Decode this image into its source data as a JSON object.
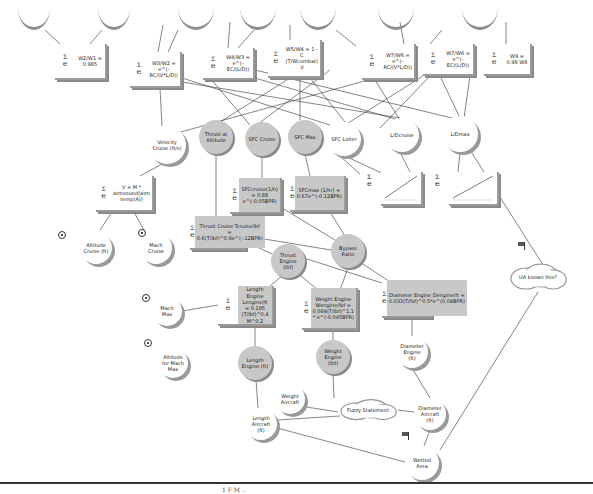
{
  "diagram": {
    "type": "influence-diagram",
    "formula_glyph": "Σ/e",
    "top_arcs": [
      {
        "x": 18,
        "y": 8,
        "w": 32,
        "h": 22
      },
      {
        "x": 98,
        "y": 8,
        "w": 32,
        "h": 22
      },
      {
        "x": 178,
        "y": 8,
        "w": 36,
        "h": 22
      },
      {
        "x": 240,
        "y": 8,
        "w": 36,
        "h": 22
      },
      {
        "x": 300,
        "y": 8,
        "w": 36,
        "h": 22
      },
      {
        "x": 378,
        "y": 8,
        "w": 36,
        "h": 22
      },
      {
        "x": 462,
        "y": 8,
        "w": 36,
        "h": 22
      }
    ],
    "function_nodes": [
      {
        "id": "w2w1",
        "label": "W2/W1 = 0.985",
        "x": 55,
        "y": 44,
        "w": 52,
        "h": 36,
        "gray": false
      },
      {
        "id": "w3w2",
        "label": "W3/W2 = e^(-RC/(V*L/D))",
        "x": 130,
        "y": 52,
        "w": 52,
        "h": 36,
        "gray": false
      },
      {
        "id": "w4w3",
        "label": "W4/W3 = e^(-EC/(L/D))",
        "x": 203,
        "y": 48,
        "w": 52,
        "h": 32,
        "gray": false
      },
      {
        "id": "w5w4",
        "label": "W5/W4 = 1 - C (T/Wcombat) d",
        "x": 268,
        "y": 40,
        "w": 54,
        "h": 38,
        "gray": false
      },
      {
        "id": "w7w6a",
        "label": "W7/W6 = e^(-RC/(V*L/D))",
        "x": 362,
        "y": 44,
        "w": 54,
        "h": 36,
        "gray": false
      },
      {
        "id": "w7w6b",
        "label": "W7/W6 = e^(-EC/(L/D))",
        "x": 423,
        "y": 44,
        "w": 52,
        "h": 32,
        "gray": false
      },
      {
        "id": "w9",
        "label": "W9 = 0.98 W8",
        "x": 484,
        "y": 44,
        "w": 48,
        "h": 32,
        "gray": false
      },
      {
        "id": "velocity",
        "label": "V = M * atmsound(atm temp(A))",
        "x": 96,
        "y": 176,
        "w": 58,
        "h": 36,
        "gray": false
      },
      {
        "id": "sfccruise_fn",
        "label": "SFCcruise(1/h) = 0.88 e^(-0.05BPR)",
        "x": 230,
        "y": 178,
        "w": 52,
        "h": 36,
        "gray": true
      },
      {
        "id": "sfcmax_fn",
        "label": "SFCmax (1/hr) = 0.67e^(-0.12BPR)",
        "x": 290,
        "y": 176,
        "w": 56,
        "h": 36,
        "gray": true
      },
      {
        "id": "thrust_cruise_fn",
        "label": "Thrust Cruise Tcruise/lbf = 0.6(T/lbf)^0.9e^(-.12BPR)",
        "x": 190,
        "y": 216,
        "w": 56,
        "h": 34,
        "gray": true
      },
      {
        "id": "length_fn",
        "label": "Length Engine Lengine/ft = 0.185 (T/lbf)^0.4 M^0.2",
        "x": 218,
        "y": 286,
        "w": 56,
        "h": 40,
        "gray": true
      },
      {
        "id": "weight_fn",
        "label": "Weight Engine Wengine/lbf = 0.084(T/lbf)^1.1 * e^(-0.045BPR)",
        "x": 302,
        "y": 288,
        "w": 56,
        "h": 42,
        "gray": true
      },
      {
        "id": "diameter_fn",
        "label": "Diameter Engine Dengine/ft = 0.033(T/lbf)^0.5*e^(0.04BPR)",
        "x": 382,
        "y": 280,
        "w": 50,
        "h": 38,
        "gray": true
      }
    ],
    "chart_nodes": [
      {
        "id": "sfcloiter_chart",
        "x": 381,
        "y": 172,
        "w": 40,
        "h": 32
      },
      {
        "id": "ldcruise_chart",
        "x": 449,
        "y": 172,
        "w": 48,
        "h": 32
      }
    ],
    "variable_nodes": [
      {
        "id": "velocity_cruise",
        "label": "Velocity Cruise (ft/s)",
        "x": 148,
        "y": 126,
        "d": 38,
        "gray": false
      },
      {
        "id": "thrust_altitude",
        "label": "Thrust at Altitude",
        "x": 199,
        "y": 120,
        "d": 34,
        "gray": true
      },
      {
        "id": "sfc_cruise",
        "label": "SFC Cruise",
        "x": 245,
        "y": 122,
        "d": 34,
        "gray": true
      },
      {
        "id": "sfc_max",
        "label": "SFC Max",
        "x": 288,
        "y": 120,
        "d": 34,
        "gray": true
      },
      {
        "id": "sfc_loiter",
        "label": "SFC Loiter",
        "x": 327,
        "y": 122,
        "d": 34,
        "gray": false
      },
      {
        "id": "ld_cruise",
        "label": "L/Dcruise",
        "x": 385,
        "y": 118,
        "d": 34,
        "gray": false
      },
      {
        "id": "ld_max",
        "label": "L/Dmax",
        "x": 442,
        "y": 116,
        "d": 36,
        "gray": false
      },
      {
        "id": "bypass_ratio",
        "label": "Bypass Ratio",
        "x": 331,
        "y": 234,
        "d": 34,
        "gray": true
      },
      {
        "id": "thrust_engine",
        "label": "Thrust Engine (lbf)",
        "x": 271,
        "y": 244,
        "d": 34,
        "gray": true
      },
      {
        "id": "altitude_cruise",
        "label": "Altitude Cruise (ft)",
        "x": 80,
        "y": 232,
        "d": 32,
        "gray": false
      },
      {
        "id": "mach_cruise",
        "label": "Mach Cruise",
        "x": 140,
        "y": 232,
        "d": 32,
        "gray": false
      },
      {
        "id": "mach_max",
        "label": "Mach Max",
        "x": 152,
        "y": 296,
        "d": 30,
        "gray": false
      },
      {
        "id": "altitude_mach_max",
        "label": "Altitude for Mach Max",
        "x": 158,
        "y": 348,
        "d": 30,
        "gray": false
      },
      {
        "id": "length_engine",
        "label": "Length Engine (ft)",
        "x": 238,
        "y": 346,
        "d": 34,
        "gray": true
      },
      {
        "id": "weight_engine",
        "label": "Weight Engine (lbf)",
        "x": 316,
        "y": 340,
        "d": 34,
        "gray": true
      },
      {
        "id": "diameter_engine",
        "label": "Diameter Engine (ft)",
        "x": 396,
        "y": 336,
        "d": 32,
        "gray": false
      },
      {
        "id": "weight_aircraft",
        "label": "Weight Aircraft",
        "x": 275,
        "y": 384,
        "d": 30,
        "gray": false
      },
      {
        "id": "length_aircraft",
        "label": "Length Aircraft (ft)",
        "x": 245,
        "y": 408,
        "d": 32,
        "gray": false
      },
      {
        "id": "diameter_aircraft",
        "label": "Diameter Aircraft (ft)",
        "x": 414,
        "y": 398,
        "d": 32,
        "gray": false
      },
      {
        "id": "wetted_area",
        "label": "Wetted Area",
        "x": 405,
        "y": 446,
        "d": 34,
        "gray": false
      }
    ],
    "clouds": [
      {
        "id": "ua_knows",
        "label": "UA knows this?",
        "x": 508,
        "y": 262,
        "w": 60,
        "h": 30
      },
      {
        "id": "fuzzy_statement",
        "label": "Fuzzy Statement",
        "x": 338,
        "y": 398,
        "w": 60,
        "h": 24
      }
    ],
    "input_markers": [
      {
        "for": "altitude_cruise",
        "x": 58,
        "y": 231
      },
      {
        "for": "mach_cruise",
        "x": 138,
        "y": 229
      },
      {
        "for": "mach_max",
        "x": 142,
        "y": 294
      },
      {
        "for": "altitude_mach_max",
        "x": 144,
        "y": 339
      }
    ],
    "flags": [
      {
        "for": "ua_knows",
        "x": 518,
        "y": 242
      },
      {
        "for": "wetted_area",
        "x": 402,
        "y": 432
      }
    ],
    "footer": "1  F  M  .."
  }
}
